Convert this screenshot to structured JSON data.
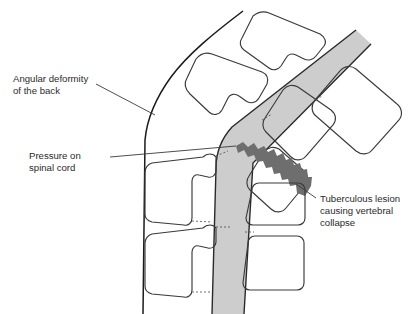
{
  "figure": {
    "background_color": "#ffffff",
    "line_color": "#1a1a1a",
    "text_color": "#2b2b2b"
  },
  "colors": {
    "spinal_cord_fill": "#cdcdcd",
    "lesion_fill": "#6e6e6e",
    "outline": "#2a2a2a",
    "leader_line": "#3a3a3a"
  },
  "labels": [
    {
      "id": "angular-deformity",
      "lines": [
        "Angular deformity",
        "of the back"
      ],
      "line1": "Angular deformity",
      "line2": "of the back",
      "x": 13,
      "y": 82
    },
    {
      "id": "pressure-spinal-cord",
      "lines": [
        "Pressure on",
        "spinal cord"
      ],
      "line1": "Pressure on",
      "line2": "spinal cord",
      "x": 29,
      "y": 159
    },
    {
      "id": "tuberculous-lesion",
      "lines": [
        "Tuberculous lesion",
        "causing vertebral",
        "collapse"
      ],
      "line1": "Tuberculous lesion",
      "line2": "causing vertebral",
      "line3": "collapse",
      "x": 320,
      "y": 202
    }
  ],
  "anatomy": {
    "spinal_cord": "light gray band bending at the kyphotic apex",
    "lesion": "dark gray jagged wedge at collapsed vertebra",
    "back_contour": "curved outline of the angular deformity (gibbus)",
    "vertebrae_count_upper": 3,
    "vertebrae_count_lower": 4
  }
}
